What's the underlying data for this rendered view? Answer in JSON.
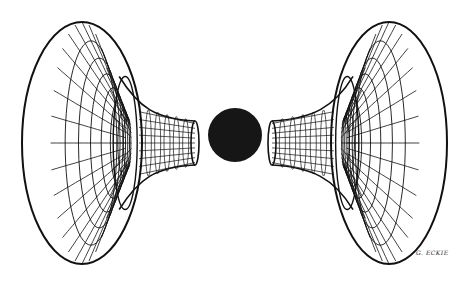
{
  "illustration": {
    "description": "Line drawing of two wireframe funnel (trumpet/horn) surfaces facing each other with a solid black sphere between them",
    "colors": {
      "background": "#ffffff",
      "ink": "#111111"
    },
    "left_funnel": {
      "rim_center": [
        82,
        143
      ],
      "rim_rx": 60,
      "rim_ry": 121,
      "neck_end_x": 195,
      "neck_half_height": 22
    },
    "right_funnel": {
      "rim_center": [
        389,
        143
      ],
      "rim_rx": 58,
      "rim_ry": 121,
      "neck_end_x": 272,
      "neck_half_height": 22
    },
    "sphere": {
      "center": [
        235,
        135
      ],
      "radius": 27
    },
    "signature": "G. ECKIE"
  }
}
